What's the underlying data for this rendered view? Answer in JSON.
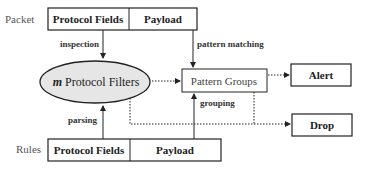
{
  "diagram": {
    "packet": {
      "label": "Packet",
      "fields": [
        "Protocol Fields",
        "Payload"
      ]
    },
    "rules": {
      "label": "Rules",
      "fields": [
        "Protocol Fields",
        "Payload"
      ]
    },
    "filters": {
      "prefix": "m",
      "label": " Protocol Filters"
    },
    "pattern_groups": {
      "label": "Pattern Groups"
    },
    "alert": {
      "label": "Alert"
    },
    "drop": {
      "label": "Drop"
    },
    "edges": {
      "inspection": "inspection",
      "pattern_matching": "pattern matching",
      "parsing": "parsing",
      "grouping": "grouping"
    }
  }
}
